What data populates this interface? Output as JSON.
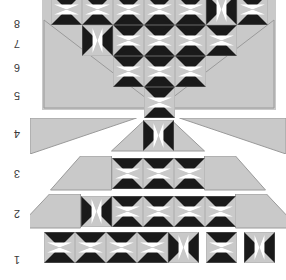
{
  "figure": {
    "kind": "quilt-row-layout-diagram",
    "orientation": "rotated-180",
    "background_color": "#ffffff",
    "gray_color": "#c9c9c9",
    "black_color": "#1a1a1a",
    "white_color": "#ffffff",
    "outline_color": "#9a9a9a"
  },
  "axis": {
    "name": "row-number-axis",
    "position": "left",
    "labels": [
      "1",
      "2",
      "3",
      "4",
      "5",
      "6",
      "7",
      "8"
    ]
  },
  "rows": [
    {
      "number": "1",
      "block_count": 7,
      "shape": "straight-strip",
      "blocks": [
        {
          "style": "hourglass",
          "rotation": 0
        },
        {
          "style": "hourglass",
          "rotation": 0
        },
        {
          "style": "hourglass",
          "rotation": 0
        },
        {
          "style": "hourglass",
          "rotation": 0
        },
        {
          "style": "hourglass",
          "rotation": 90
        },
        {
          "style": "hourglass",
          "rotation": 0
        },
        {
          "style": "hourglass",
          "rotation": 90
        }
      ]
    },
    {
      "number": "2",
      "block_count": 5,
      "shape": "trapezoid-with-side-triangles",
      "blocks": [
        {
          "style": "hourglass",
          "rotation": 90
        },
        {
          "style": "hourglass",
          "rotation": 0
        },
        {
          "style": "hourglass",
          "rotation": 0
        },
        {
          "style": "hourglass",
          "rotation": 0
        },
        {
          "style": "hourglass",
          "rotation": 0
        }
      ]
    },
    {
      "number": "3",
      "block_count": 3,
      "shape": "trapezoid-with-side-triangles",
      "blocks": [
        {
          "style": "hourglass",
          "rotation": 0
        },
        {
          "style": "hourglass",
          "rotation": 0
        },
        {
          "style": "hourglass",
          "rotation": 0
        }
      ]
    },
    {
      "number": "4",
      "block_count": 1,
      "shape": "peak-with-wide-side-triangles",
      "blocks": [
        {
          "style": "hourglass",
          "rotation": 90
        }
      ]
    },
    {
      "number": "5",
      "block_count": 1,
      "shape": "chevron-tip",
      "blocks": [
        {
          "style": "hourglass",
          "rotation": 0
        }
      ]
    },
    {
      "number": "6",
      "block_count": 3,
      "shape": "chevron-band",
      "blocks": [
        {
          "style": "hourglass",
          "rotation": 0
        },
        {
          "style": "hourglass",
          "rotation": 0
        },
        {
          "style": "hourglass",
          "rotation": 0
        }
      ]
    },
    {
      "number": "7",
      "block_count": 5,
      "shape": "chevron-band",
      "blocks": [
        {
          "style": "hourglass",
          "rotation": 90
        },
        {
          "style": "hourglass",
          "rotation": 0
        },
        {
          "style": "hourglass",
          "rotation": 0
        },
        {
          "style": "hourglass",
          "rotation": 0
        },
        {
          "style": "hourglass",
          "rotation": 0
        }
      ]
    },
    {
      "number": "8",
      "block_count": 7,
      "shape": "chevron-band-top",
      "blocks": [
        {
          "style": "hourglass",
          "rotation": 0
        },
        {
          "style": "hourglass",
          "rotation": 0
        },
        {
          "style": "hourglass",
          "rotation": 0
        },
        {
          "style": "hourglass",
          "rotation": 0
        },
        {
          "style": "hourglass",
          "rotation": 0
        },
        {
          "style": "hourglass",
          "rotation": 90
        },
        {
          "style": "hourglass",
          "rotation": 0
        }
      ]
    }
  ]
}
